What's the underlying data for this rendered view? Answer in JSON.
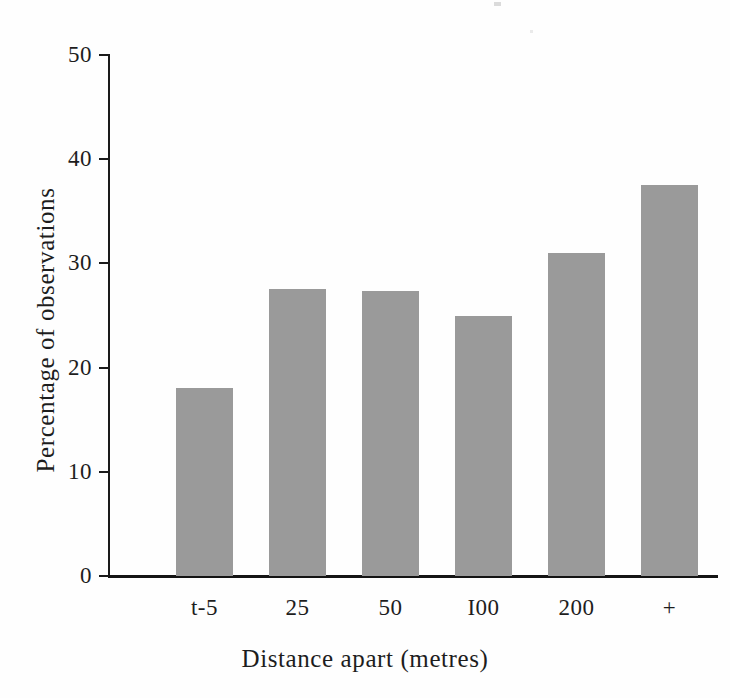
{
  "figure": {
    "background_color": "#ffffff",
    "bar_color": "#9a9a9a",
    "axis_color": "#1a1a1a",
    "text_color": "#1d1d1d"
  },
  "chart_data": {
    "type": "bar",
    "title": "",
    "xlabel": "Distance apart (metres)",
    "ylabel": "Percentage of observations",
    "categories": [
      "t-5",
      "25",
      "50",
      "I00",
      "200",
      "+"
    ],
    "values": [
      18,
      27.5,
      27.4,
      25,
      31,
      37.5
    ],
    "ylim": [
      0,
      50
    ],
    "yticks": [
      0,
      10,
      20,
      30,
      40,
      50
    ],
    "ytick_labels": [
      "0",
      "10",
      "20",
      "30",
      "40",
      "50"
    ],
    "grid": false,
    "legend": null,
    "orientation": "vertical",
    "series": [
      {
        "name": "Percentage of observations",
        "values": [
          18,
          27.5,
          27.4,
          25,
          31,
          37.5
        ]
      }
    ]
  }
}
